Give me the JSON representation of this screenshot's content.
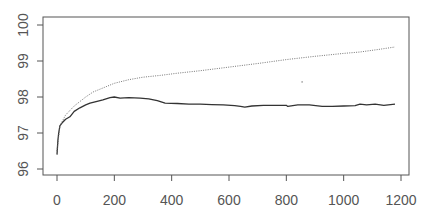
{
  "chart_data": {
    "type": "line",
    "title": "",
    "xlabel": "",
    "ylabel": "",
    "xlim": [
      0,
      1200
    ],
    "ylim": [
      96,
      100
    ],
    "grid": false,
    "legend": null,
    "x_ticks": [
      0,
      200,
      400,
      600,
      800,
      1000,
      1200
    ],
    "y_ticks": [
      96,
      97,
      98,
      99,
      100
    ],
    "x_tick_labels": [
      "0",
      "200",
      "400",
      "600",
      "800",
      "1000",
      "1200"
    ],
    "y_tick_labels": [
      "96",
      "97",
      "98",
      "99",
      "100"
    ],
    "series": [
      {
        "name": "solid",
        "style": "solid",
        "color": "#333333",
        "x": [
          0,
          3,
          6,
          10,
          20,
          30,
          45,
          60,
          80,
          100,
          115,
          140,
          160,
          185,
          200,
          220,
          250,
          290,
          320,
          350,
          377,
          420,
          460,
          500,
          540,
          580,
          620,
          640,
          655,
          680,
          720,
          760,
          800,
          805,
          840,
          880,
          925,
          960,
          1000,
          1040,
          1057,
          1080,
          1110,
          1140,
          1179
        ],
        "y": [
          96.4,
          96.8,
          97.0,
          97.2,
          97.3,
          97.38,
          97.45,
          97.6,
          97.7,
          97.78,
          97.83,
          97.88,
          97.92,
          97.98,
          98.0,
          97.97,
          97.98,
          97.97,
          97.95,
          97.9,
          97.83,
          97.82,
          97.8,
          97.8,
          97.79,
          97.78,
          97.76,
          97.74,
          97.72,
          97.75,
          97.77,
          97.77,
          97.77,
          97.74,
          97.78,
          97.78,
          97.74,
          97.74,
          97.75,
          97.76,
          97.8,
          97.78,
          97.8,
          97.77,
          97.8
        ]
      },
      {
        "name": "dotted",
        "style": "dotted",
        "color": "#666666",
        "x": [
          0,
          10,
          30,
          60,
          100,
          126,
          160,
          200,
          250,
          300,
          360,
          420,
          500,
          600,
          708,
          800,
          900,
          1000,
          1057,
          1120,
          1179
        ],
        "y": [
          96.5,
          97.2,
          97.5,
          97.75,
          98.0,
          98.14,
          98.25,
          98.38,
          98.48,
          98.55,
          98.6,
          98.66,
          98.73,
          98.83,
          98.94,
          99.04,
          99.13,
          99.21,
          99.25,
          99.32,
          99.39
        ]
      }
    ],
    "annotations": [
      {
        "type": "point",
        "x": 855,
        "y": 98.42
      }
    ]
  }
}
